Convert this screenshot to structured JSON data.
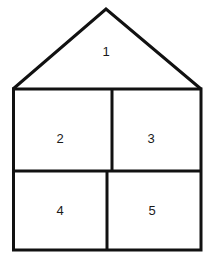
{
  "diagram": {
    "regions": [
      {
        "id": "1",
        "label": "1",
        "shape": "roof-triangle"
      },
      {
        "id": "2",
        "label": "2",
        "shape": "upper-left-rectangle"
      },
      {
        "id": "3",
        "label": "3",
        "shape": "upper-right-rectangle"
      },
      {
        "id": "4",
        "label": "4",
        "shape": "lower-left-rectangle"
      },
      {
        "id": "5",
        "label": "5",
        "shape": "lower-right-rectangle"
      }
    ],
    "stroke_color": "#111111",
    "background": "#ffffff"
  }
}
